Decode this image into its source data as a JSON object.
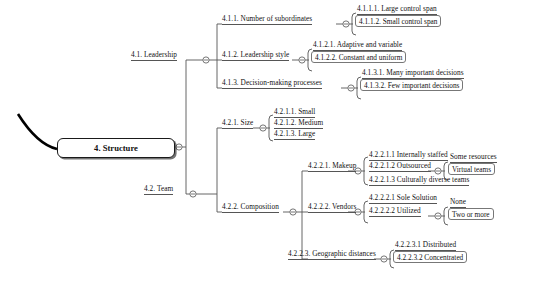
{
  "diagram": {
    "title": "4. Structure",
    "type": "mind-map",
    "root": {
      "label": "4. Structure"
    },
    "nodes": [
      {
        "id": "4.1",
        "label": "4.1. Leadership"
      },
      {
        "id": "4.1.1",
        "label": "4.1.1. Number of subordinates"
      },
      {
        "id": "4.1.1.1",
        "label": "4.1.1.1. Large control span"
      },
      {
        "id": "4.1.1.2",
        "label": "4.1.1.2. Small control span"
      },
      {
        "id": "4.1.2",
        "label": "4.1.2. Leadership style"
      },
      {
        "id": "4.1.2.1",
        "label": "4.1.2.1. Adaptive and variable"
      },
      {
        "id": "4.1.2.2",
        "label": "4.1.2.2. Constant and uniform"
      },
      {
        "id": "4.1.3",
        "label": "4.1.3. Decision-making processes"
      },
      {
        "id": "4.1.3.1",
        "label": "4.1.3.1. Many important decisions"
      },
      {
        "id": "4.1.3.2",
        "label": "4.1.3.2. Few important decisions"
      },
      {
        "id": "4.2",
        "label": "4.2. Team"
      },
      {
        "id": "4.2.1",
        "label": "4.2.1. Size"
      },
      {
        "id": "4.2.1.1",
        "label": "4.2.1.1. Small"
      },
      {
        "id": "4.2.1.2",
        "label": "4.2.1.2. Medium"
      },
      {
        "id": "4.2.1.3",
        "label": "4.2.1.3. Large"
      },
      {
        "id": "4.2.2",
        "label": "4.2.2. Composition"
      },
      {
        "id": "4.2.2.1",
        "label": "4.2.2.1. Makeup"
      },
      {
        "id": "4.2.2.1.1",
        "label": "4.2.2.1.1 Internally staffed"
      },
      {
        "id": "4.2.2.1.2",
        "label": "4.2.2.1.2 Outsourced"
      },
      {
        "id": "4.2.2.1.2a",
        "label": "Some resources"
      },
      {
        "id": "4.2.2.1.2b",
        "label": "Virtual teams"
      },
      {
        "id": "4.2.2.1.3",
        "label": "4.2.2.1.3 Culturally diverse teams"
      },
      {
        "id": "4.2.2.2",
        "label": "4.2.2.2. Vendors"
      },
      {
        "id": "4.2.2.2.1",
        "label": "4.2.2.2.1 Sole Solution"
      },
      {
        "id": "4.2.2.2.2",
        "label": "4.2.2.2.2 Utilized"
      },
      {
        "id": "4.2.2.2.2a",
        "label": "None"
      },
      {
        "id": "4.2.2.2.2b",
        "label": "Two or more"
      },
      {
        "id": "4.2.2.3",
        "label": "4.2.2.3. Geographic distances"
      },
      {
        "id": "4.2.2.3.1",
        "label": "4.2.2.3.1 Distributed"
      },
      {
        "id": "4.2.2.3.2",
        "label": "4.2.2.3.2 Concentrated"
      }
    ],
    "colors": {
      "background": "#ffffff",
      "text": "#111111",
      "branch_line": "#555555",
      "root_border": "#1a1a1a",
      "incoming_curve": "#000000"
    }
  }
}
